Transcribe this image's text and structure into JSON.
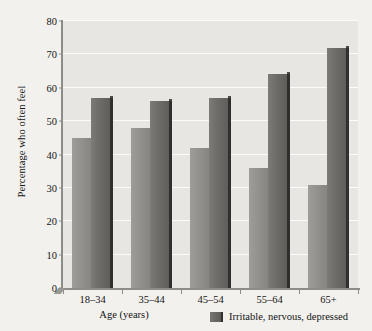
{
  "chart_data": {
    "type": "bar",
    "title": "",
    "subtitle": "",
    "xlabel": "Age (years)",
    "ylabel": "Percentage who often feel",
    "categories": [
      "18–34",
      "35–44",
      "45–54",
      "55–64",
      "65+"
    ],
    "series": [
      {
        "name": "",
        "values": [
          45,
          48,
          42,
          36,
          31
        ]
      },
      {
        "name": "Irritable, nervous, depressed",
        "values": [
          57,
          56,
          57,
          64,
          72
        ]
      }
    ],
    "ylim": [
      0,
      80
    ],
    "yticks": [
      0,
      10,
      20,
      30,
      40,
      50,
      60,
      70,
      80
    ],
    "ytick_labels": [
      "0",
      "10",
      "20",
      "30",
      "40",
      "50",
      "60",
      "70",
      "80"
    ],
    "grid": true,
    "grid_axis": "y",
    "legend_position": "bottom-right",
    "legend_entries": [
      {
        "label": "Irritable, nervous, depressed",
        "swatch": "legend-swatch-dark"
      }
    ],
    "colors": {
      "plot_background": "#e7e6e2",
      "page_background": "#f2f1ee",
      "gridline": "#fbfbf9",
      "axis": "#8d8d88",
      "series_1_bar": "#93928e",
      "series_2_bar": "#6e6d69",
      "bar_side_shadow": "#2f2f2d",
      "text": "#141414"
    }
  }
}
